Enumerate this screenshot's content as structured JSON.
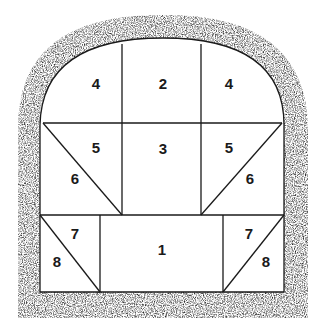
{
  "diagram": {
    "type": "tunnel-excavation-sequence-cross-section",
    "colors": {
      "rock": "#2a2a2a",
      "lines": "#1a1a1a",
      "background": "#ffffff"
    },
    "sections": [
      {
        "id": "s1",
        "label": "1",
        "position": "bottom-center"
      },
      {
        "id": "s2",
        "label": "2",
        "position": "top-center"
      },
      {
        "id": "s3",
        "label": "3",
        "position": "middle-center"
      },
      {
        "id": "s4l",
        "label": "4",
        "position": "top-left"
      },
      {
        "id": "s4r",
        "label": "4",
        "position": "top-right"
      },
      {
        "id": "s5l",
        "label": "5",
        "position": "middle-left-upper"
      },
      {
        "id": "s5r",
        "label": "5",
        "position": "middle-right-upper"
      },
      {
        "id": "s6l",
        "label": "6",
        "position": "middle-left-lower"
      },
      {
        "id": "s6r",
        "label": "6",
        "position": "middle-right-lower"
      },
      {
        "id": "s7l",
        "label": "7",
        "position": "bottom-left-upper"
      },
      {
        "id": "s7r",
        "label": "7",
        "position": "bottom-right-upper"
      },
      {
        "id": "s8l",
        "label": "8",
        "position": "bottom-left-lower"
      },
      {
        "id": "s8r",
        "label": "8",
        "position": "bottom-right-lower"
      }
    ]
  }
}
